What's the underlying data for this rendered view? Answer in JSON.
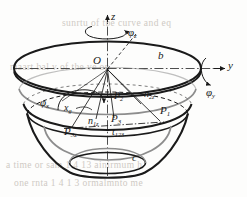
{
  "figure": {
    "title_semantic": "paraboloid-bowl-with-rotation-axes",
    "colors": {
      "ink": "#1a1a1a",
      "gray_curve": "#8d8d8d",
      "axis_dashdot": "#3a3a3a",
      "bleed_text": "#cfcac4",
      "paper": "#fdfdfc"
    },
    "axes": [
      {
        "name": "z-axis",
        "label": "z"
      },
      {
        "name": "y-axis",
        "label": "y"
      }
    ],
    "rotation_labels": [
      {
        "name": "phi-z",
        "base": "φ",
        "sub": "z"
      },
      {
        "name": "phi-y",
        "base": "φ",
        "sub": "y"
      },
      {
        "name": "phi-x",
        "base": "φ",
        "sub": "x"
      }
    ],
    "point_labels": [
      {
        "name": "origin",
        "base": "O",
        "sub": ""
      },
      {
        "name": "top-rim-b",
        "base": "b",
        "sub": ""
      },
      {
        "name": "bottom-c",
        "base": "c",
        "sub": ""
      },
      {
        "name": "axis-x",
        "base": "x",
        "sub": "g"
      },
      {
        "name": "normal-1",
        "base": "n",
        "sub": "1z"
      },
      {
        "name": "normal-2",
        "base": "n",
        "sub": "2z"
      },
      {
        "name": "normal-3",
        "base": "n",
        "sub": "3z"
      },
      {
        "name": "point-1",
        "base": "P",
        "sub": "1"
      },
      {
        "name": "point-2",
        "base": "P",
        "sub": "2"
      },
      {
        "name": "point-3",
        "base": "P",
        "sub": "3"
      },
      {
        "name": "tangent-123",
        "base": "t",
        "sub": "123"
      }
    ],
    "bleed_through_lines": [
      "sunrtu     of   tbe  curve    and   eq",
      "maart  bal   v      of    the   ve    on",
      "a  time    or   sam    1 4 13 ainirmum  h",
      "one    rnta  1 4 1 3 ormalmnto  me"
    ]
  }
}
